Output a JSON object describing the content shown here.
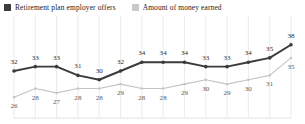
{
  "legend": {
    "entries": [
      {
        "label": "Retirement plan employer offers",
        "color": "#3b3b3b",
        "icon": "square-swatch"
      },
      {
        "label": "Amount of money earned",
        "color": "#c9c9c9",
        "icon": "square-swatch"
      }
    ]
  },
  "chart_data": {
    "type": "line",
    "title": "",
    "xlabel": "",
    "ylabel": "",
    "grid": true,
    "legend_position": "top-left",
    "ylim": [
      24,
      40
    ],
    "x": [
      1,
      2,
      3,
      4,
      5,
      6,
      7,
      8,
      9,
      10,
      11,
      12,
      13,
      14
    ],
    "series": [
      {
        "name": "Retirement plan employer offers",
        "color": "#3b3b3b",
        "values": [
          32,
          33,
          33,
          31,
          30,
          32,
          34,
          34,
          34,
          33,
          33,
          34,
          35,
          38
        ],
        "labels": [
          "32",
          "33",
          "33",
          "31",
          "30",
          "32",
          "34",
          "34",
          "34",
          "33",
          "33",
          "34",
          "35",
          "38"
        ]
      },
      {
        "name": "Amount of money earned",
        "color": "#c4c4c4",
        "values": [
          26,
          28,
          27,
          28,
          28,
          29,
          28,
          28,
          29,
          30,
          29,
          30,
          31,
          35
        ],
        "labels": [
          "26",
          "28",
          "27",
          "28",
          "28",
          "29",
          "28",
          "28",
          "29",
          "30",
          "29",
          "30",
          "31",
          "35"
        ]
      }
    ]
  }
}
